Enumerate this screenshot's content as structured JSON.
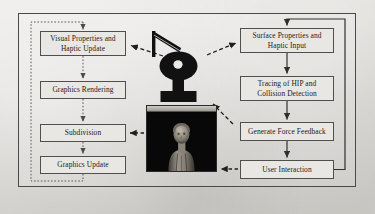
{
  "figure": {
    "background_color": "#d8d6d2",
    "frame_color": "#4a4a48",
    "box_fill": "#e9e7e3",
    "box_border": "#4f4f4d",
    "solid_arrow_color": "#2f2f2f",
    "dashed_arrow_color": "#2f2f2f",
    "dotted_loop_color": "#5a5a58"
  },
  "graphic_loop": {
    "label": "graphic-rendering-loop",
    "style": "dotted",
    "boxes": [
      {
        "id": "visual-properties",
        "label": "Visual Properties and\nHaptic Update",
        "line1": "Visual Properties and",
        "line2": "Haptic Update"
      },
      {
        "id": "graphics-rendering",
        "label": "Graphics Rendering",
        "line1": "Graphics Rendering",
        "line2": ""
      },
      {
        "id": "subdivision",
        "label": "Subdivision",
        "line1": "Subdivision",
        "line2": ""
      },
      {
        "id": "graphics-update",
        "label": "Graphics Update",
        "line1": "Graphics Update",
        "line2": ""
      }
    ]
  },
  "haptic_loop": {
    "label": "haptic-rendering-loop",
    "style": "solid",
    "boxes": [
      {
        "id": "surface-properties",
        "label": "Surface Properties and\nHaptic Input",
        "line1": "Surface Properties and",
        "line2": "Haptic Input"
      },
      {
        "id": "tracing-hip",
        "label": "Tracing of HIP and\nCollision Detection",
        "line1": "Tracing of HIP and",
        "line2": "Collision Detection"
      },
      {
        "id": "force-feedback",
        "label": "Generate Force Feedback",
        "line1": "Generate Force Feedback",
        "line2": ""
      },
      {
        "id": "user-interaction",
        "label": "User Interaction",
        "line1": "User Interaction",
        "line2": ""
      }
    ]
  },
  "center": {
    "haptic_device": {
      "name": "haptic-device-silhouette",
      "description": "PHANTOM-style haptic stylus arm on torus base",
      "color": "#111111"
    },
    "render_window": {
      "name": "3d-render-window",
      "titlebar_text": "",
      "background_color": "#070707",
      "subject": "3D scanned bust sculpture"
    }
  },
  "connections": [
    {
      "from": "visual-properties",
      "to": "graphics-rendering",
      "style": "dotted",
      "direction": "down"
    },
    {
      "from": "graphics-rendering",
      "to": "subdivision",
      "style": "dotted",
      "direction": "down"
    },
    {
      "from": "subdivision",
      "to": "graphics-update",
      "style": "dotted",
      "direction": "down"
    },
    {
      "from": "graphics-update",
      "to": "visual-properties",
      "style": "dotted",
      "direction": "loop-left"
    },
    {
      "from": "surface-properties",
      "to": "tracing-hip",
      "style": "solid",
      "direction": "down"
    },
    {
      "from": "tracing-hip",
      "to": "force-feedback",
      "style": "solid",
      "direction": "down"
    },
    {
      "from": "force-feedback",
      "to": "user-interaction",
      "style": "solid",
      "direction": "down"
    },
    {
      "from": "user-interaction",
      "to": "surface-properties",
      "style": "solid",
      "direction": "loop-right"
    },
    {
      "from": "haptic-device",
      "to": "visual-properties",
      "style": "dashed",
      "direction": "left"
    },
    {
      "from": "haptic-device",
      "to": "surface-properties",
      "style": "dashed",
      "direction": "right"
    },
    {
      "from": "render-window",
      "to": "subdivision",
      "style": "dashed",
      "direction": "left"
    },
    {
      "from": "user-interaction",
      "to": "render-window",
      "style": "dashed",
      "direction": "left"
    },
    {
      "from": "render-window",
      "to": "haptic-device",
      "style": "dashed",
      "direction": "up-right"
    }
  ]
}
